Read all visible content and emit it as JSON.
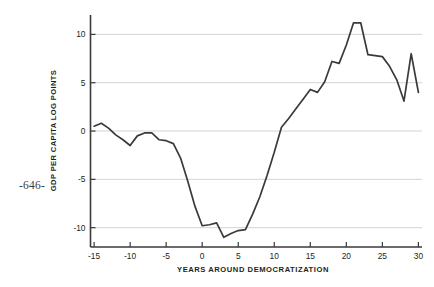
{
  "page": {
    "folio": "-646-"
  },
  "chart_data": {
    "type": "line",
    "title": "",
    "subtitle": "",
    "xlabel": "YEARS AROUND DEMOCRATIZATION",
    "ylabel": "GDP PER CAPITA LOG POINTS",
    "xlim": [
      -15.5,
      30.5
    ],
    "ylim": [
      -12.0,
      11.8
    ],
    "xticks": [
      -15,
      -10,
      -5,
      0,
      5,
      10,
      15,
      20,
      25,
      30
    ],
    "xticklabels": [
      "-15",
      "-10",
      "-5",
      "0",
      "5",
      "10",
      "15",
      "20",
      "25",
      "30"
    ],
    "yticks": [
      -10,
      -5,
      0,
      5,
      10
    ],
    "yticklabels": [
      "-10",
      "-5",
      "0",
      "5",
      "10"
    ],
    "grid": "horizontal",
    "grid_color": "#c9c9c9",
    "line_color": "#3a3a3a",
    "legend": null,
    "legend_position": "none",
    "series": [
      {
        "name": "GDP per capita log points",
        "x": [
          -15,
          -14,
          -13,
          -12,
          -11,
          -10,
          -9,
          -8,
          -7,
          -6,
          -5,
          -4,
          -3,
          -2,
          -1,
          0,
          1,
          2,
          3,
          4,
          5,
          6,
          7,
          8,
          9,
          10,
          11,
          12,
          13,
          14,
          15,
          16,
          17,
          18,
          19,
          20,
          21,
          22,
          23,
          24,
          25,
          26,
          27,
          28,
          29,
          30
        ],
        "values": [
          0.5,
          0.8,
          0.3,
          -0.4,
          -0.9,
          -1.5,
          -0.5,
          -0.2,
          -0.2,
          -0.9,
          -1.0,
          -1.3,
          -2.8,
          -5.2,
          -7.8,
          -9.8,
          -9.7,
          -9.5,
          -11.0,
          -10.6,
          -10.3,
          -10.2,
          -8.6,
          -6.8,
          -4.6,
          -2.2,
          0.4,
          1.3,
          2.3,
          3.3,
          4.3,
          4.0,
          5.1,
          7.2,
          7.0,
          8.9,
          11.2,
          11.2,
          7.9,
          7.8,
          7.7,
          6.7,
          5.3,
          3.1,
          8.0,
          4.0
        ]
      }
    ]
  }
}
